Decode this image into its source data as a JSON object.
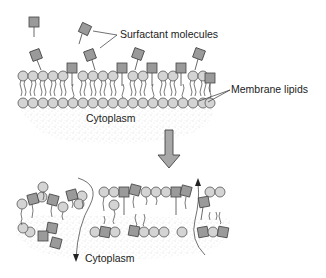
{
  "diagram": {
    "labels": {
      "surfactant": "Surfactant  molecules",
      "membrane_lipids": "Membrane lipids",
      "cytoplasm_top": "Cytoplasm",
      "cytoplasm_bottom": "Cytoplasm"
    },
    "colors": {
      "lipid_head": "#d4d4d4",
      "surfactant_head": "#9a9a9a",
      "outline": "#444444",
      "arrow_fill": "#a8a8a8",
      "cytoplasm_stipple": "#bbbbbb"
    },
    "panels": [
      {
        "id": "intact",
        "description": "Intact lipid bilayer with surfactant molecules inserting into outer leaflet"
      },
      {
        "id": "disrupted",
        "description": "Disrupted bilayer with pores allowing leakage to/from cytoplasm"
      }
    ],
    "transition_arrow": "down"
  }
}
